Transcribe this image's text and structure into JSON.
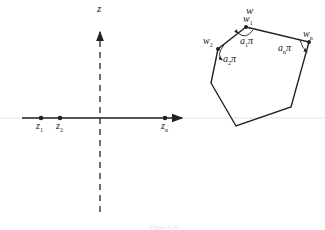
{
  "z_plane": {
    "title": "z",
    "points": [
      {
        "label": "z",
        "sub": "1"
      },
      {
        "label": "z",
        "sub": "2"
      },
      {
        "label": "z",
        "sub": "n"
      }
    ]
  },
  "w_plane": {
    "title": "w",
    "vertices": [
      {
        "label": "w",
        "sub": "1"
      },
      {
        "label": "w",
        "sub": "2"
      },
      {
        "label": "w",
        "sub": "n"
      }
    ],
    "angles": [
      {
        "label": "a",
        "sub": "1",
        "pi": "π"
      },
      {
        "label": "a",
        "sub": "2",
        "pi": "π"
      },
      {
        "label": "a",
        "sub": "n",
        "pi": "π"
      }
    ]
  },
  "caption": "Figure 4.16"
}
